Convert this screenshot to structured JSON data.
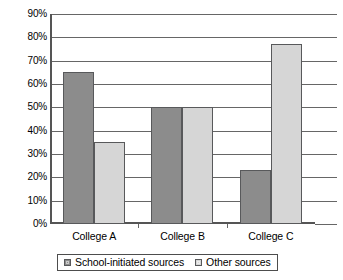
{
  "chart_data": {
    "type": "bar",
    "title": "",
    "subtitle": "",
    "xlabel": "",
    "ylabel": "",
    "categories": [
      "College A",
      "College B",
      "College C"
    ],
    "series": [
      {
        "name": "School-initiated sources",
        "values": [
          65,
          50,
          23
        ],
        "color": "#8c8c8c"
      },
      {
        "name": "Other sources",
        "values": [
          35,
          50,
          77
        ],
        "color": "#d6d6d6"
      }
    ],
    "ylim": [
      0,
      90
    ],
    "ytick_step": 10,
    "ytick_labels": [
      "0%",
      "10%",
      "20%",
      "30%",
      "40%",
      "50%",
      "60%",
      "70%",
      "80%",
      "90%"
    ],
    "value_format": "percent",
    "grid": true,
    "grid_axis": "y",
    "legend": true,
    "legend_position": "bottom"
  },
  "legend": {
    "entries": [
      {
        "label": "School-initiated sources",
        "swatch": "dark-gray-swatch"
      },
      {
        "label": "Other sources",
        "swatch": "light-gray-swatch"
      }
    ]
  },
  "colors": {
    "series_dark": "#8c8c8c",
    "series_light": "#d6d6d6",
    "axis": "#555555",
    "gridline": "#666666",
    "text": "#000000",
    "background": "#ffffff"
  }
}
